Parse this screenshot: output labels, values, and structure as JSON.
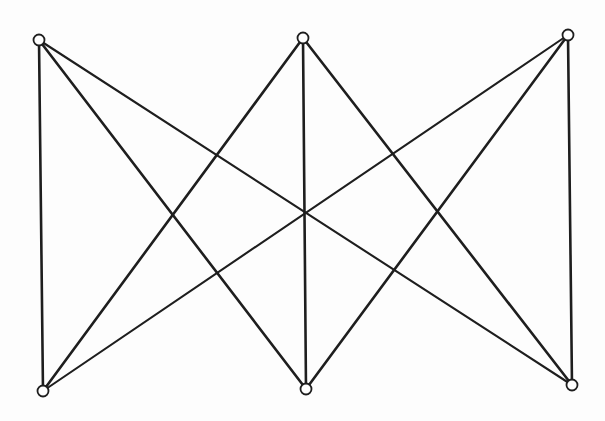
{
  "diagram": {
    "type": "graph",
    "name": "K3,3",
    "directed": false,
    "colors": {
      "background": "#ffffff",
      "edge": "#1e1e1e",
      "vertex_fill": "#ffffff",
      "vertex_stroke": "#1e1e1e"
    },
    "vertex_radius": 5.5,
    "vertices": [
      {
        "id": "A",
        "row": "top",
        "x": 39,
        "y": 40
      },
      {
        "id": "B",
        "row": "top",
        "x": 303,
        "y": 38
      },
      {
        "id": "C",
        "row": "top",
        "x": 568,
        "y": 35
      },
      {
        "id": "D",
        "row": "bottom",
        "x": 43,
        "y": 391
      },
      {
        "id": "E",
        "row": "bottom",
        "x": 306,
        "y": 389
      },
      {
        "id": "F",
        "row": "bottom",
        "x": 572,
        "y": 385
      }
    ],
    "edges": [
      {
        "from": "A",
        "to": "D",
        "weight": "thick"
      },
      {
        "from": "A",
        "to": "E",
        "weight": "thick"
      },
      {
        "from": "A",
        "to": "F",
        "weight": "thin"
      },
      {
        "from": "B",
        "to": "D",
        "weight": "thick"
      },
      {
        "from": "B",
        "to": "E",
        "weight": "thick"
      },
      {
        "from": "B",
        "to": "F",
        "weight": "thick"
      },
      {
        "from": "C",
        "to": "D",
        "weight": "thin"
      },
      {
        "from": "C",
        "to": "E",
        "weight": "thick"
      },
      {
        "from": "C",
        "to": "F",
        "weight": "thick"
      }
    ]
  }
}
